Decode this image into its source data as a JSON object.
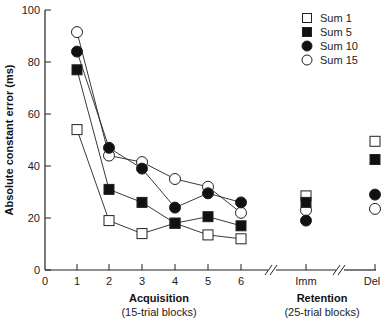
{
  "chart_data": {
    "type": "line",
    "title": "",
    "ylabel": "Absolute constant error (ms)",
    "ylim": [
      0,
      100
    ],
    "yticks": [
      0,
      20,
      40,
      60,
      80,
      100
    ],
    "x_groups": [
      {
        "label": "Acquisition",
        "sublabel": "(15-trial blocks)",
        "categories": [
          "1",
          "2",
          "3",
          "4",
          "5",
          "6"
        ]
      },
      {
        "label": "Retention",
        "sublabel": "(25-trial blocks)",
        "categories": [
          "Imm",
          "Del"
        ]
      }
    ],
    "x_tick_labels": [
      "0",
      "1",
      "2",
      "3",
      "4",
      "5",
      "6",
      "Imm",
      "Del"
    ],
    "categories": [
      "1",
      "2",
      "3",
      "4",
      "5",
      "6",
      "Imm",
      "Del"
    ],
    "series": [
      {
        "name": "Sum 1",
        "marker": "open-square",
        "values": [
          54,
          19,
          14,
          18,
          13.5,
          12,
          28.5,
          49.5
        ]
      },
      {
        "name": "Sum 5",
        "marker": "filled-square",
        "values": [
          77,
          31,
          26,
          18,
          20.5,
          17,
          26,
          42.5
        ]
      },
      {
        "name": "Sum 10",
        "marker": "filled-circle",
        "values": [
          84,
          47,
          39,
          24,
          29.5,
          26,
          19,
          29
        ]
      },
      {
        "name": "Sum 15",
        "marker": "open-circle",
        "values": [
          91.5,
          44,
          41.5,
          35,
          32,
          22,
          23,
          23.5
        ]
      }
    ],
    "connected_range": "acquisition blocks 1-6 connected by lines; retention points unconnected",
    "axis_breaks": [
      "between 6 and Imm",
      "between Imm and Del"
    ],
    "legend_position": "upper right",
    "grid": false
  },
  "legend": {
    "items": [
      "Sum 1",
      "Sum 5",
      "Sum 10",
      "Sum 15"
    ]
  },
  "axes": {
    "ylabel": "Absolute constant error (ms)",
    "acquisition_label": "Acquisition",
    "acquisition_sub": "(15-trial blocks)",
    "retention_label": "Retention",
    "retention_sub": "(25-trial blocks)"
  }
}
